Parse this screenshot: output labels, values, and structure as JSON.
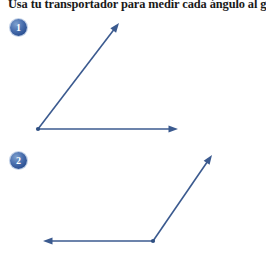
{
  "page": {
    "title_text": "Usa tu transportador para medir cada ángulo al gra",
    "background_color": "#ffffff",
    "width": 266,
    "height": 265
  },
  "style": {
    "ray_color": "#3b5a8f",
    "ray_width": 1.6,
    "vertex_color": "#2f4f82",
    "badge_color": "#2f5496",
    "badge_ring_color": "#c3d2e8",
    "badge_text_color": "#ffffff",
    "title_color": "#1a1a1a"
  },
  "problems": [
    {
      "number": "1",
      "badge": {
        "x": 10,
        "y": 19,
        "size": 17
      },
      "vertex": {
        "x": 38,
        "y": 129
      },
      "rays": [
        {
          "name": "horizontal-ray",
          "direction": "right",
          "end": {
            "x": 178,
            "y": 129
          },
          "arrowhead": true
        },
        {
          "name": "diagonal-ray",
          "direction": "up-right",
          "end": {
            "x": 119,
            "y": 23
          },
          "arrowhead": true
        }
      ],
      "angle_degrees": 37,
      "angle_type": "acute"
    },
    {
      "number": "2",
      "badge": {
        "x": 10,
        "y": 152,
        "size": 17
      },
      "vertex": {
        "x": 153,
        "y": 241
      },
      "rays": [
        {
          "name": "horizontal-ray",
          "direction": "left",
          "end": {
            "x": 43,
            "y": 241
          },
          "arrowhead": true
        },
        {
          "name": "diagonal-ray",
          "direction": "up-right",
          "end": {
            "x": 212,
            "y": 155
          },
          "arrowhead": true
        }
      ],
      "angle_degrees": 135,
      "angle_type": "obtuse"
    }
  ]
}
